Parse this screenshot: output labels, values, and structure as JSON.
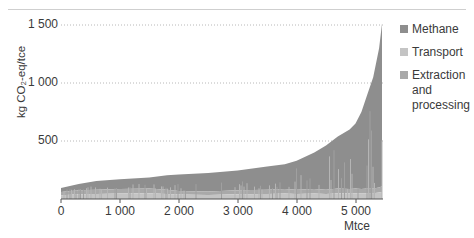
{
  "chart_data": {
    "type": "area",
    "title": "",
    "xlabel": "Mtce",
    "ylabel": "kg CO₂-eq/tce",
    "xlim": [
      0,
      5450
    ],
    "ylim": [
      0,
      1500
    ],
    "x_ticks": [
      "0",
      "1 000",
      "2 000",
      "3 000",
      "4 000",
      "5 000"
    ],
    "y_ticks": [
      "500",
      "1 000",
      "1 500"
    ],
    "grid": "horizontal dotted",
    "legend_position": "right",
    "stacked": true,
    "series": [
      {
        "name": "Methane",
        "color": "#8e8e8e"
      },
      {
        "name": "Transport",
        "color": "#c4c4c4"
      },
      {
        "name": "Extraction and processing",
        "color": "#a9a9a9"
      }
    ],
    "x": [
      0,
      300,
      600,
      1000,
      1500,
      1800,
      2000,
      2500,
      3000,
      3500,
      3800,
      4000,
      4300,
      4500,
      4700,
      4900,
      5000,
      5100,
      5200,
      5300,
      5400,
      5450
    ],
    "total": [
      95,
      130,
      155,
      170,
      185,
      205,
      210,
      225,
      245,
      280,
      300,
      330,
      400,
      460,
      540,
      600,
      650,
      750,
      900,
      1050,
      1300,
      1510
    ],
    "base_estimate": [
      60,
      75,
      80,
      85,
      90,
      80,
      70,
      65,
      75,
      80,
      85,
      80,
      85,
      80,
      90,
      85,
      90,
      85,
      90,
      90,
      100,
      110
    ]
  },
  "legend": {
    "items": [
      {
        "label": "Methane",
        "color": "#8e8e8e"
      },
      {
        "label": "Transport",
        "color": "#c4c4c4"
      },
      {
        "label": "Extraction and processing",
        "color": "#a9a9a9"
      }
    ]
  },
  "axes": {
    "ylabel": "kg CO₂-eq/tce",
    "xlabel": "Mtce",
    "y_ticks": [
      {
        "label": "1 500",
        "y": 25
      },
      {
        "label": "1 000",
        "y": 83
      },
      {
        "label": "500",
        "y": 141
      }
    ],
    "x_ticks": [
      {
        "label": "0",
        "x": 61
      },
      {
        "label": "1 000",
        "x": 120
      },
      {
        "label": "2 000",
        "x": 179
      },
      {
        "label": "3 000",
        "x": 238
      },
      {
        "label": "4 000",
        "x": 297
      },
      {
        "label": "5 000",
        "x": 356
      }
    ]
  }
}
